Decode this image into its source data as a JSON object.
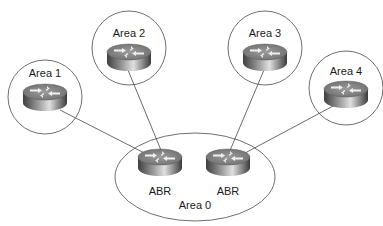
{
  "diagram": {
    "type": "OSPF multi-area topology",
    "areas": [
      {
        "id": "area1",
        "label": "Area 1",
        "cx": 45,
        "cy": 97,
        "r": 37
      },
      {
        "id": "area2",
        "label": "Area 2",
        "cx": 129,
        "cy": 48,
        "r": 37
      },
      {
        "id": "area3",
        "label": "Area 3",
        "cx": 265,
        "cy": 48,
        "r": 37
      },
      {
        "id": "area4",
        "label": "Area 4",
        "cx": 346,
        "cy": 88,
        "r": 37
      }
    ],
    "backbone": {
      "id": "area0",
      "label": "Area 0",
      "cx": 195,
      "cy": 177,
      "rx": 80,
      "ry": 44
    },
    "abrs": [
      {
        "id": "abr-left",
        "label": "ABR",
        "cx": 160,
        "cy": 162
      },
      {
        "id": "abr-right",
        "label": "ABR",
        "cx": 228,
        "cy": 162
      }
    ],
    "links": [
      {
        "from": "area1",
        "to": "abr-left"
      },
      {
        "from": "area2",
        "to": "abr-left"
      },
      {
        "from": "area3",
        "to": "abr-right"
      },
      {
        "from": "area4",
        "to": "abr-right"
      }
    ],
    "colors": {
      "outline": "#4a4a4a",
      "link": "#5a5a5a",
      "router_top": "#8a8a8a",
      "router_side_dark": "#3e3e3e",
      "router_side_light": "#d8d8d8",
      "arrow": "#f2f2f2",
      "text": "#1a1a1a"
    }
  }
}
